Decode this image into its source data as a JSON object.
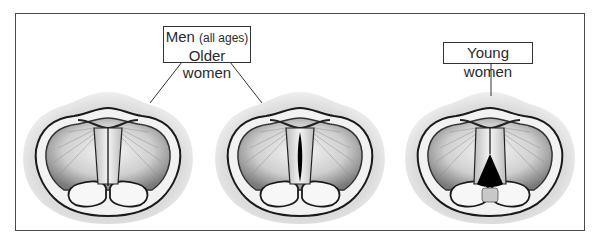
{
  "figure": {
    "labels": {
      "group1": {
        "line1_main": "Men",
        "line1_note": "(all ages)",
        "line2": "Older women"
      },
      "group2": {
        "text": "Young women"
      }
    },
    "panels": [
      {
        "id": "closed-glottis",
        "description": "Vocal folds fully closed"
      },
      {
        "id": "midline-gap",
        "description": "Vocal folds with narrow midline gap"
      },
      {
        "id": "posterior-gap",
        "description": "Vocal folds with posterior triangular gap"
      }
    ],
    "colors": {
      "frame": "#4a4a4a",
      "halo": "#d9d9d9",
      "ink": "#1a1a1a",
      "fold": "#e8e8e8"
    }
  }
}
